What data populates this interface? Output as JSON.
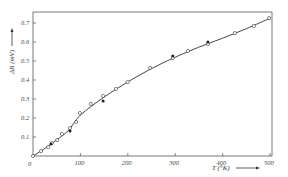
{
  "chart_data": {
    "type": "scatter",
    "title": "",
    "xlabel": "T (°K)",
    "ylabel": "ΔB (mV)",
    "xlim": [
      0,
      510
    ],
    "ylim": [
      0,
      0.77
    ],
    "grid": false,
    "legend": null,
    "x_ticks": [
      {
        "value": 0,
        "label": "0"
      },
      {
        "value": 100,
        "label": "100"
      },
      {
        "value": 200,
        "label": "200"
      },
      {
        "value": 300,
        "label": "300"
      },
      {
        "value": 400,
        "label": "400"
      },
      {
        "value": 500,
        "label": "500"
      }
    ],
    "y_ticks": [
      {
        "value": 0.1,
        "label": "0.1"
      },
      {
        "value": 0.2,
        "label": "0.2"
      },
      {
        "value": 0.3,
        "label": "0.3"
      },
      {
        "value": 0.4,
        "label": "0.4"
      },
      {
        "value": 0.5,
        "label": "0.5"
      },
      {
        "value": 0.6,
        "label": "0.6"
      },
      {
        "value": 0.7,
        "label": "0.7"
      }
    ],
    "series": [
      {
        "name": "open-circles",
        "marker": "open-circle",
        "points": [
          [
            0,
            0.0
          ],
          [
            17,
            0.026
          ],
          [
            32,
            0.047
          ],
          [
            40,
            0.068
          ],
          [
            51,
            0.084
          ],
          [
            61,
            0.116
          ],
          [
            78,
            0.147
          ],
          [
            91,
            0.179
          ],
          [
            99,
            0.226
          ],
          [
            122,
            0.274
          ],
          [
            148,
            0.316
          ],
          [
            175,
            0.353
          ],
          [
            200,
            0.389
          ],
          [
            247,
            0.463
          ],
          [
            295,
            0.516
          ],
          [
            327,
            0.553
          ],
          [
            369,
            0.589
          ],
          [
            426,
            0.647
          ],
          [
            466,
            0.684
          ],
          [
            498,
            0.726
          ]
        ]
      },
      {
        "name": "filled-dots",
        "marker": "filled-circle",
        "points": [
          [
            38,
            0.063
          ],
          [
            78,
            0.132
          ],
          [
            148,
            0.289
          ],
          [
            295,
            0.526
          ],
          [
            369,
            0.6
          ]
        ]
      },
      {
        "name": "fit-curve",
        "marker": "line",
        "points": [
          [
            0,
            0.0
          ],
          [
            25,
            0.04
          ],
          [
            50,
            0.085
          ],
          [
            75,
            0.135
          ],
          [
            100,
            0.215
          ],
          [
            150,
            0.31
          ],
          [
            200,
            0.39
          ],
          [
            250,
            0.46
          ],
          [
            300,
            0.52
          ],
          [
            350,
            0.573
          ],
          [
            400,
            0.62
          ],
          [
            450,
            0.67
          ],
          [
            500,
            0.725
          ]
        ]
      }
    ]
  },
  "axes": {
    "x_title": "T (°K)",
    "y_title": "ΔB (mV)",
    "origin_label": "0"
  },
  "colors": {
    "line": "#333333",
    "frame": "#555555",
    "marker_fill": "#222222"
  }
}
